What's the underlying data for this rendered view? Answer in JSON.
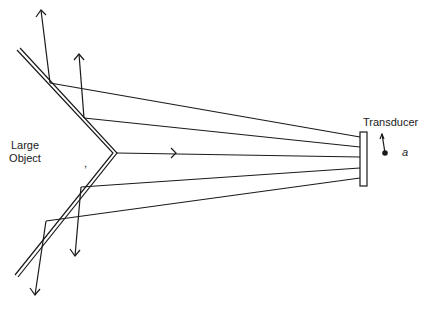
{
  "diagram": {
    "labels": {
      "object_line1": "Large",
      "object_line2": "Object",
      "transducer": "Transducer",
      "point": "a",
      "tick_mark": ","
    },
    "stroke_color": "#1a1a1a",
    "background": "#ffffff"
  }
}
